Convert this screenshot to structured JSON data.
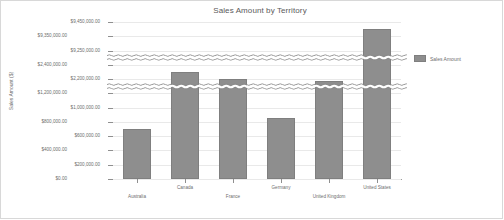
{
  "chart_data": {
    "type": "bar",
    "title": "Sales Amount by Territory",
    "xlabel": "",
    "ylabel": "Sales Amount ($)",
    "categories": [
      "Australia",
      "Canada",
      "France",
      "Germany",
      "United Kingdom",
      "United States"
    ],
    "values": [
      700000,
      2300000,
      2200000,
      850000,
      2100000,
      9400000
    ],
    "series": [
      {
        "name": "Sales Amount",
        "values": [
          700000,
          2300000,
          2200000,
          850000,
          2100000,
          9400000
        ]
      }
    ],
    "ytick_labels": [
      "$0.00",
      "$200,000.00",
      "$400,000.00",
      "$600,000.00",
      "$800,000.00",
      "$1,000,000.00",
      "$1,200,000.00",
      "$2,200,000.00",
      "$2,400,000.00",
      "$9,250,000.00",
      "$9,350,000.00",
      "$9,450,000.00"
    ],
    "ytick_values": [
      0,
      200000,
      400000,
      600000,
      800000,
      1000000,
      1200000,
      2200000,
      2400000,
      9250000,
      9350000,
      9450000
    ],
    "axis_breaks": [
      1200000,
      2400000
    ],
    "ylim": [
      0,
      9450000
    ],
    "grid": true,
    "legend_position": "right",
    "bar_color": "#8e8e8e",
    "grid_color": "#e9e9e9",
    "axis_color": "#9b9b9b",
    "text_color": "#6d6d6d"
  },
  "legend": {
    "entries": [
      {
        "label": "Sales Amount",
        "color": "#8e8e8e"
      }
    ]
  }
}
